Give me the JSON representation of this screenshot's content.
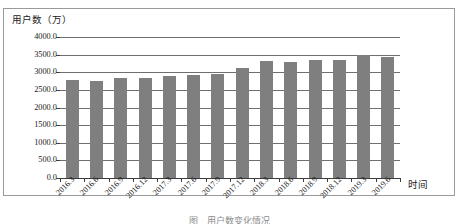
{
  "chart_data": {
    "type": "bar",
    "title": "",
    "ylabel": "用户数（万）",
    "xlabel": "时间",
    "ylim": [
      0,
      4000
    ],
    "ytick_labels": [
      "4000.0",
      "3500.0",
      "3000.0",
      "2500.0",
      "2000.0",
      "1500.0",
      "1000.0",
      "500.0",
      "0.0"
    ],
    "ytick_values": [
      4000,
      3500,
      3000,
      2500,
      2000,
      1500,
      1000,
      500,
      0
    ],
    "grid": true,
    "legend": "none",
    "bar_color": "#7f7f7f",
    "categories": [
      "2016.3",
      "2016.6",
      "2016.9",
      "2016.12",
      "2017.3",
      "2017.6",
      "2017.9",
      "2017.12",
      "2018.3",
      "2018.6",
      "2018.9",
      "2018.12",
      "2019.3",
      "2019.6"
    ],
    "values": [
      2790,
      2750,
      2830,
      2840,
      2900,
      2930,
      2950,
      3110,
      3330,
      3290,
      3350,
      3340,
      3480,
      3440
    ]
  },
  "caption": {
    "text": "图　用户数变化情况"
  }
}
